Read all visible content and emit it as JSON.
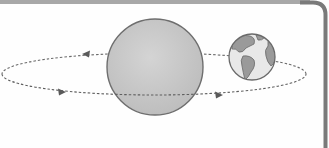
{
  "diagram": {
    "title": "",
    "colors": {
      "background": "#fefefe",
      "frame_border": "#7a7a7a",
      "top_bar": "#a8a8a8",
      "sphere_fill": "#c9c9c9",
      "sphere_stroke": "#6e6e6e",
      "orbit_stroke": "#6a6a6a",
      "earth_ocean": "#e6e6e6",
      "earth_land": "#9a9a9a",
      "earth_stroke": "#6a6a6a"
    },
    "objects": [
      {
        "name": "large-sphere",
        "shape": "circle"
      },
      {
        "name": "earth",
        "shape": "circle"
      },
      {
        "name": "orbit-path",
        "shape": "dashed-ellipse"
      }
    ],
    "arrows": [
      {
        "position": "upper-left",
        "direction": "left"
      },
      {
        "position": "lower-left",
        "direction": "right"
      },
      {
        "position": "lower-right",
        "direction": "right"
      }
    ]
  }
}
